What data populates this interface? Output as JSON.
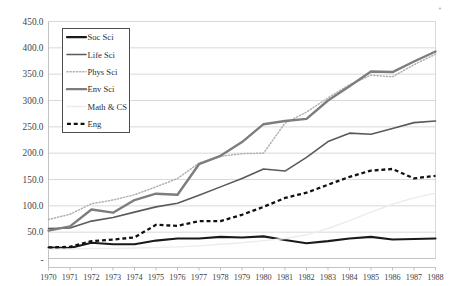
{
  "chart_data": {
    "type": "line",
    "title": "",
    "xlabel": "",
    "ylabel": "",
    "x": [
      1970,
      1971,
      1972,
      1973,
      1974,
      1975,
      1976,
      1977,
      1978,
      1979,
      1980,
      1981,
      1982,
      1983,
      1984,
      1985,
      1986,
      1987,
      1988
    ],
    "categories": [
      "1970",
      "1971",
      "1972",
      "1973",
      "1974",
      "1975",
      "1976",
      "1977",
      "1978",
      "1979",
      "1980",
      "1981",
      "1982",
      "1983",
      "1984",
      "1985",
      "1986",
      "1987",
      "1988"
    ],
    "ylim": [
      0,
      450
    ],
    "ytick_values": [
      0,
      50,
      100,
      150,
      200,
      250,
      300,
      350,
      400,
      450
    ],
    "ytick_labels": [
      "-",
      "50.0",
      "100.0",
      "150.0",
      "200.0",
      "250.0",
      "300.0",
      "350.0",
      "400.0",
      "450.0"
    ],
    "grid": true,
    "legend_position": "upper-left-inside",
    "series": [
      {
        "name": "Soc Sci",
        "style": "solid",
        "color": "#1a1a1a",
        "width": 2.1,
        "values": [
          21,
          20,
          30,
          27,
          27,
          34,
          38,
          38,
          41,
          40,
          42,
          35,
          29,
          33,
          38,
          41,
          36,
          37,
          38
        ]
      },
      {
        "name": "Life Sci",
        "style": "solid",
        "color": "#5a5a5a",
        "width": 1.6,
        "values": [
          57,
          58,
          71,
          78,
          88,
          98,
          105,
          120,
          136,
          152,
          170,
          166,
          192,
          222,
          238,
          236,
          247,
          258,
          261
        ]
      },
      {
        "name": "Phys Sci",
        "style": "dotted",
        "color": "#b0b0b0",
        "width": 1.5,
        "values": [
          74,
          84,
          104,
          111,
          121,
          136,
          152,
          181,
          194,
          199,
          200,
          257,
          278,
          305,
          330,
          348,
          345,
          368,
          388
        ]
      },
      {
        "name": "Env Sci",
        "style": "solid",
        "color": "#7d7d7d",
        "width": 2.4,
        "values": [
          53,
          61,
          93,
          87,
          111,
          123,
          121,
          179,
          195,
          221,
          255,
          261,
          265,
          300,
          327,
          355,
          354,
          374,
          393
        ]
      },
      {
        "name": "Math & CS",
        "style": "solid",
        "color": "#ececec",
        "width": 1.4,
        "values": [
          18,
          18,
          19,
          19,
          20,
          21,
          22,
          24,
          27,
          30,
          34,
          38,
          45,
          57,
          72,
          88,
          103,
          115,
          124
        ]
      },
      {
        "name": "Eng",
        "style": "dashed",
        "color": "#111111",
        "width": 2.3,
        "values": [
          21,
          22,
          33,
          36,
          40,
          64,
          62,
          71,
          71,
          83,
          98,
          115,
          125,
          140,
          155,
          167,
          170,
          152,
          157
        ]
      }
    ]
  },
  "legend": {
    "items": [
      {
        "label": "Soc Sci"
      },
      {
        "label": "Life Sci"
      },
      {
        "label": "Phys Sci"
      },
      {
        "label": "Env Sci"
      },
      {
        "label": "Math & CS"
      },
      {
        "label": "Eng"
      }
    ]
  }
}
